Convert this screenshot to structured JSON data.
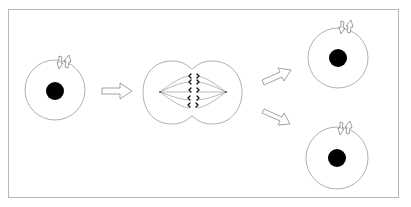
{
  "diagram": {
    "title": "",
    "type": "cell-division",
    "colors": {
      "stroke": "#9a9a9a",
      "nucleus": "#000000",
      "background": "#ffffff",
      "frame": "#b8b8b8"
    },
    "stages": [
      {
        "id": "parent-cell",
        "label": ""
      },
      {
        "id": "dividing-cell",
        "label": ""
      },
      {
        "id": "daughter-cell-top",
        "label": ""
      },
      {
        "id": "daughter-cell-bottom",
        "label": ""
      }
    ]
  }
}
